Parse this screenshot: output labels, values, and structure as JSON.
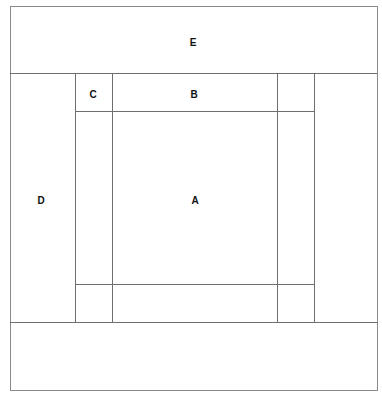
{
  "diagram": {
    "type": "layout-grid",
    "regions": [
      {
        "id": "E",
        "label": "E",
        "description": "top band"
      },
      {
        "id": "D",
        "label": "D",
        "description": "left column"
      },
      {
        "id": "C",
        "label": "C",
        "description": "top-left corner cell"
      },
      {
        "id": "B",
        "label": "B",
        "description": "top center cell"
      },
      {
        "id": "A",
        "label": "A",
        "description": "center cell"
      }
    ],
    "colors": {
      "line": "#6e6e6e",
      "border": "#8a8a8a",
      "text": "#111111",
      "background": "#ffffff"
    }
  }
}
